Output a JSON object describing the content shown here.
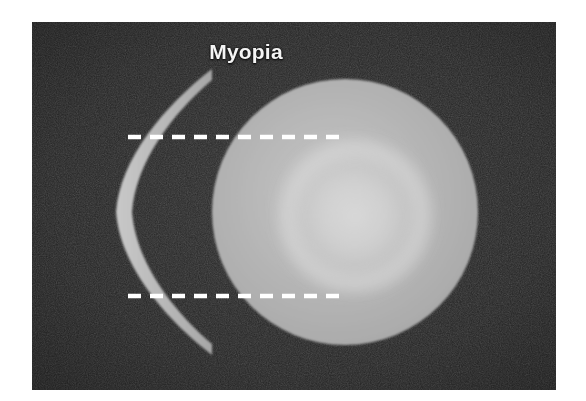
{
  "figure": {
    "title": "Myopia",
    "kind": "ophthalmology-diagram",
    "background_color": "#ffffff",
    "panel_color": "#232323"
  },
  "panel": {
    "x": 32,
    "y": 22,
    "width": 524,
    "height": 368,
    "texture": "film-grain-noise"
  },
  "elements": {
    "title_label": "Myopia",
    "title_color": "#f4f4f4",
    "lens": {
      "name": "concave-minus-lens",
      "color": "#b8b8b8",
      "shape": "biconcave-crescent",
      "top_y": 80,
      "bottom_y": 355,
      "left_x": 100,
      "right_x": 212
    },
    "eyeball": {
      "name": "eyeball-sphere",
      "color": "#b2b2b2",
      "center_x": 345,
      "center_y": 212,
      "radius": 133
    },
    "inner_glow": {
      "name": "retinal-glow",
      "color": "#d4d4d4",
      "center_x": 355,
      "center_y": 216,
      "radius": 80
    },
    "ray_lines": [
      {
        "name": "upper-light-ray",
        "y": 137,
        "x_start": 128,
        "x_end": 344,
        "style": "dashed",
        "color": "#ffffff"
      },
      {
        "name": "lower-light-ray",
        "y": 296,
        "x_start": 128,
        "x_end": 344,
        "style": "dashed",
        "color": "#ffffff"
      }
    ]
  }
}
